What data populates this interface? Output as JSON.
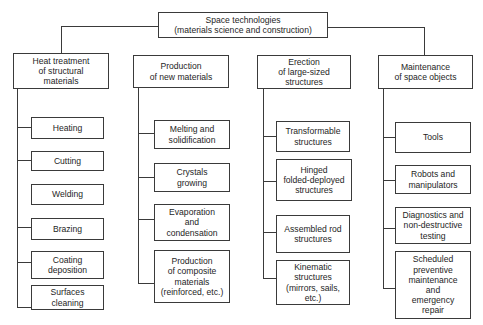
{
  "root": {
    "label": "Space technologies\n(materials science and construction)"
  },
  "categories": [
    {
      "label": "Heat treatment\nof structural\nmaterials",
      "children": [
        {
          "label": "Heating"
        },
        {
          "label": "Cutting"
        },
        {
          "label": "Welding"
        },
        {
          "label": "Brazing"
        },
        {
          "label": "Coating\ndeposition"
        },
        {
          "label": "Surfaces\ncleaning"
        }
      ]
    },
    {
      "label": "Production\nof new materials",
      "children": [
        {
          "label": "Melting and\nsolidification"
        },
        {
          "label": "Crystals\ngrowing"
        },
        {
          "label": "Evaporation\nand\ncondensation"
        },
        {
          "label": "Production\nof composite\nmaterials\n(reinforced, etc.)"
        }
      ]
    },
    {
      "label": "Erection\nof large-sized\nstructures",
      "children": [
        {
          "label": "Transformable\nstructures"
        },
        {
          "label": "Hinged\nfolded-deployed\nstructures"
        },
        {
          "label": "Assembled rod\nstructures"
        },
        {
          "label": "Kinematic\nstructures\n(mirrors, sails,\netc.)"
        }
      ]
    },
    {
      "label": "Maintenance\nof space objects",
      "children": [
        {
          "label": "Tools"
        },
        {
          "label": "Robots and\nmanipulators"
        },
        {
          "label": "Diagnostics and\nnon-destructive\ntesting"
        },
        {
          "label": "Scheduled\npreventive\nmaintenance\nand\nemergency\nrepair"
        }
      ]
    }
  ],
  "colors": {
    "line": "#3a3a3a",
    "text": "#1e1e1e",
    "background": "#ffffff"
  }
}
